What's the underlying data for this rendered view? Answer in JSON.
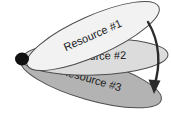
{
  "diagram": {
    "background_color": "#ffffff",
    "pivot": {
      "label": "pivot-point",
      "cx": 22,
      "cy": 59,
      "rx": 7,
      "ry": 6.5,
      "color": "#111111"
    },
    "resources": [
      {
        "id": "resource-1",
        "label": "Resource #1",
        "fill": "#f2f2f2",
        "stroke": "#4d4d4d",
        "rotation_deg": -24,
        "cx": 93,
        "cy": 36,
        "rx": 72,
        "ry": 20,
        "text_x": 93,
        "text_y": 36
      },
      {
        "id": "resource-2",
        "label": "Resource #2",
        "fill": "#dcdcdc",
        "stroke": "#4d4d4d",
        "rotation_deg": -2,
        "cx": 95,
        "cy": 57,
        "rx": 73,
        "ry": 18,
        "text_x": 95,
        "text_y": 57
      },
      {
        "id": "resource-3",
        "label": "Resource #3",
        "fill": "#b3b3b3",
        "stroke": "#4d4d4d",
        "rotation_deg": 16,
        "cx": 91,
        "cy": 80,
        "rx": 73,
        "ry": 20,
        "text_x": 91,
        "text_y": 80
      }
    ],
    "rotation_arrow": {
      "label": "rotation-direction-arrow",
      "color": "#2b2b2b",
      "path": "M 148 22 C 160 42, 161 66, 154 86",
      "head_points": "154,94 148.5,79.5 160.5,80.5"
    }
  }
}
